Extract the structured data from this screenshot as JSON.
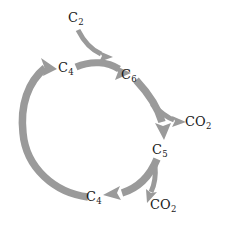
{
  "diagram": {
    "type": "cycle-diagram",
    "background_color": "#ffffff",
    "arrow_color": "#9a9a9a",
    "text_color": "#1a1a1a",
    "nodes": [
      {
        "id": "c2",
        "element": "C",
        "subscript": "2",
        "label": "C2",
        "role": "input-two-carbon"
      },
      {
        "id": "c4_top",
        "element": "C",
        "subscript": "4",
        "label": "C4",
        "role": "four-carbon-acceptor"
      },
      {
        "id": "c6",
        "element": "C",
        "subscript": "6",
        "label": "C6",
        "role": "six-carbon-intermediate"
      },
      {
        "id": "co2_top",
        "element": "CO",
        "subscript": "2",
        "label": "CO2",
        "role": "first-decarboxylation-output"
      },
      {
        "id": "c5",
        "element": "C",
        "subscript": "5",
        "label": "C5",
        "role": "five-carbon-intermediate"
      },
      {
        "id": "co2_bot",
        "element": "CO",
        "subscript": "2",
        "label": "CO2",
        "role": "second-decarboxylation-output"
      },
      {
        "id": "c4_bot",
        "element": "C",
        "subscript": "4",
        "label": "C4",
        "role": "four-carbon-regenerated"
      }
    ],
    "arrows": [
      {
        "id": "a1",
        "from": "c2",
        "to": "c4_top_junction",
        "style": "curved-input"
      },
      {
        "id": "a2",
        "from": "c4_top",
        "to": "c6",
        "style": "curved-thick"
      },
      {
        "id": "a3",
        "from": "c6",
        "to": "c5",
        "style": "curved-thick"
      },
      {
        "id": "a4",
        "from": "c6_arc",
        "to": "co2_top",
        "style": "branch-output"
      },
      {
        "id": "a5",
        "from": "c5",
        "to": "c4_bot",
        "style": "curved-thick"
      },
      {
        "id": "a6",
        "from": "c5_arc",
        "to": "co2_bot",
        "style": "branch-output"
      },
      {
        "id": "a7",
        "from": "c4_bot",
        "to": "c4_top",
        "style": "curved-thick-arc"
      }
    ]
  }
}
